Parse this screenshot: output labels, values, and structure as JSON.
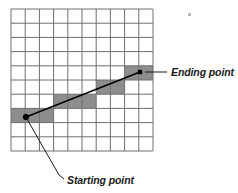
{
  "grid": {
    "columns": 10,
    "rows": 10,
    "origin_x": 11,
    "origin_y": 9,
    "cell_size": 14.2,
    "line_color": "#6f6f6f",
    "line_width": 1,
    "background": "#ffffff"
  },
  "shading": {
    "fill_color": "#8d8d8d",
    "cells": [
      {
        "col": 0,
        "row": 7
      },
      {
        "col": 1,
        "row": 7
      },
      {
        "col": 2,
        "row": 7
      },
      {
        "col": 3,
        "row": 6
      },
      {
        "col": 4,
        "row": 6
      },
      {
        "col": 5,
        "row": 6
      },
      {
        "col": 6,
        "row": 5
      },
      {
        "col": 7,
        "row": 5
      },
      {
        "col": 8,
        "row": 4
      },
      {
        "col": 9,
        "row": 4
      }
    ]
  },
  "line": {
    "color": "#000000",
    "width": 1.6,
    "start": {
      "x": 26,
      "y": 117
    },
    "end": {
      "x": 140,
      "y": 72
    }
  },
  "markers": {
    "start": {
      "shape": "dot",
      "x": 26,
      "y": 117,
      "size": 3.1,
      "color": "#000000"
    },
    "end": {
      "shape": "square",
      "x": 140,
      "y": 72,
      "size": 4.4,
      "color": "#000000"
    }
  },
  "annotations": [
    {
      "id": "ending-point",
      "label": "Ending point",
      "text_x": 171,
      "text_y": 76,
      "leader": {
        "x1": 145,
        "y1": 72,
        "x2": 167,
        "y2": 72
      },
      "color": "#1a1a1a"
    },
    {
      "id": "starting-point",
      "label": "Starting point",
      "text_x": 67,
      "text_y": 184,
      "leader_path": "M 27 119 L 59 175 L 64 179",
      "color": "#1a1a1a"
    }
  ],
  "artifacts": {
    "speck": {
      "x": 188,
      "y": 13,
      "w": 3,
      "h": 3,
      "color": "#b9b9b9"
    }
  }
}
